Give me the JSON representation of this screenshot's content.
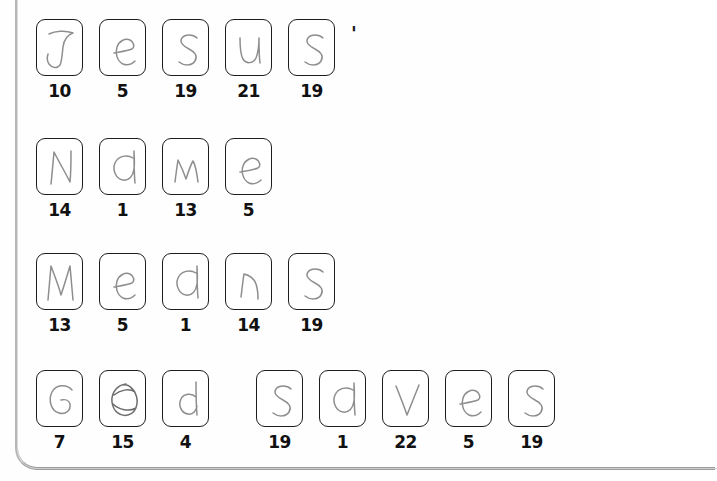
{
  "document": {
    "type": "handwriting-worksheet-scan",
    "phrase": "Jesus' Name Means God saves",
    "background_color": "#fefefe",
    "box_border_color": "#1d1d1d",
    "pencil_color": "#8e8e8e",
    "number_color": "#111111"
  },
  "punctuation": {
    "apostrophe": "'"
  },
  "rows": [
    {
      "id": "row-jesus",
      "word": "Jesus",
      "top": 19,
      "left": 36,
      "trailing_punctuation": "'",
      "cells": [
        {
          "letter": "J",
          "number": "10"
        },
        {
          "letter": "e",
          "number": "5"
        },
        {
          "letter": "s",
          "number": "19"
        },
        {
          "letter": "u",
          "number": "21"
        },
        {
          "letter": "s",
          "number": "19"
        }
      ]
    },
    {
      "id": "row-name",
      "word": "Name",
      "top": 138,
      "left": 36,
      "trailing_punctuation": "",
      "cells": [
        {
          "letter": "N",
          "number": "14"
        },
        {
          "letter": "a",
          "number": "1"
        },
        {
          "letter": "m",
          "number": "13"
        },
        {
          "letter": "e",
          "number": "5"
        }
      ]
    },
    {
      "id": "row-means",
      "word": "Means",
      "top": 253,
      "left": 36,
      "trailing_punctuation": "",
      "cells": [
        {
          "letter": "M",
          "number": "13"
        },
        {
          "letter": "e",
          "number": "5"
        },
        {
          "letter": "a",
          "number": "1"
        },
        {
          "letter": "n",
          "number": "14"
        },
        {
          "letter": "s",
          "number": "19"
        }
      ]
    },
    {
      "id": "row-god-saves",
      "word": "God saves",
      "top": 370,
      "left": 36,
      "trailing_punctuation": "",
      "cells": [
        {
          "letter": "G",
          "number": "7"
        },
        {
          "letter": "O",
          "number": "15"
        },
        {
          "letter": "d",
          "number": "4"
        },
        {
          "letter": "__gap__",
          "number": ""
        },
        {
          "letter": "s",
          "number": "19"
        },
        {
          "letter": "a",
          "number": "1"
        },
        {
          "letter": "v",
          "number": "22"
        },
        {
          "letter": "e",
          "number": "5"
        },
        {
          "letter": "s",
          "number": "19"
        }
      ]
    }
  ]
}
